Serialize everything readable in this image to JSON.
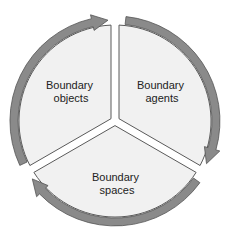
{
  "diagram": {
    "type": "cycle",
    "direction": "clockwise",
    "colors": {
      "sector_fill": "#f1f1f1",
      "sector_stroke": "#5a5a5a",
      "arrow_fill": "#8a8a8a",
      "arrow_stroke": "#555555",
      "background": "#ffffff"
    },
    "sectors": [
      {
        "id": "objects",
        "line1": "Boundary",
        "line2": "objects"
      },
      {
        "id": "agents",
        "line1": "Boundary",
        "line2": "agents"
      },
      {
        "id": "spaces",
        "line1": "Boundary",
        "line2": "spaces"
      }
    ],
    "flow": [
      {
        "from": "objects",
        "to": "agents"
      },
      {
        "from": "agents",
        "to": "spaces"
      },
      {
        "from": "spaces",
        "to": "objects"
      }
    ]
  }
}
